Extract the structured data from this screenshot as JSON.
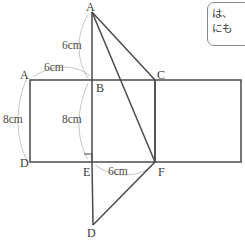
{
  "figure": {
    "stroke_color": "#4a4a4a",
    "guide_color": "#bdbdbd",
    "background": "#ffffff"
  },
  "vertices": [
    {
      "name": "apex-A",
      "label": "A",
      "x": 92,
      "y": 12,
      "label_x": 86,
      "label_y": 1
    },
    {
      "name": "rect-top-left-A",
      "label": "A",
      "x": 30,
      "y": 80,
      "label_x": 20,
      "label_y": 69
    },
    {
      "name": "point-B",
      "label": "B",
      "x": 92,
      "y": 80,
      "label_x": 96,
      "label_y": 82
    },
    {
      "name": "point-C",
      "label": "C",
      "x": 155,
      "y": 80,
      "label_x": 157,
      "label_y": 69
    },
    {
      "name": "rect-bottom-left-D",
      "label": "D",
      "x": 30,
      "y": 162,
      "label_x": 20,
      "label_y": 157
    },
    {
      "name": "point-E",
      "label": "E",
      "x": 92,
      "y": 162,
      "label_x": 83,
      "label_y": 166
    },
    {
      "name": "point-F",
      "label": "F",
      "x": 155,
      "y": 162,
      "label_x": 158,
      "label_y": 166
    },
    {
      "name": "bottom-D",
      "label": "D",
      "x": 93,
      "y": 225,
      "label_x": 87,
      "label_y": 227
    }
  ],
  "measurements": [
    {
      "name": "measure-AB-vertical",
      "text": "6cm",
      "x": 62,
      "y": 40
    },
    {
      "name": "measure-AB-horizontal",
      "text": "6cm",
      "x": 44,
      "y": 62
    },
    {
      "name": "measure-AD-left",
      "text": "8cm",
      "x": 3,
      "y": 114
    },
    {
      "name": "measure-BE-inner",
      "text": "8cm",
      "x": 62,
      "y": 114
    },
    {
      "name": "measure-EF-bottom",
      "text": "6cm",
      "x": 108,
      "y": 166
    }
  ],
  "callout": {
    "line1": "は、",
    "line2": "にも"
  }
}
